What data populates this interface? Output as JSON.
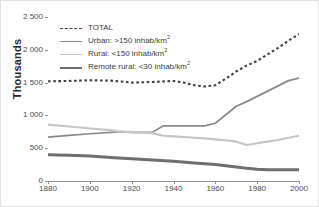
{
  "chart_data": {
    "type": "line",
    "title": "",
    "xlabel": "",
    "ylabel": "Thousands",
    "xlim": [
      1880,
      2000
    ],
    "ylim": [
      0,
      2500
    ],
    "grid": "horizontal",
    "legend_position": "top-left",
    "x_ticks": [
      "1880",
      "1900",
      "1920",
      "1940",
      "1960",
      "1980",
      "2000"
    ],
    "x_tick_values": [
      1880,
      1900,
      1920,
      1940,
      1960,
      1980,
      2000
    ],
    "y_ticks": [
      "0",
      "500",
      "1 000",
      "1 500",
      "2 000",
      "2 500"
    ],
    "y_tick_values": [
      0,
      500,
      1000,
      1500,
      2000,
      2500
    ],
    "series": [
      {
        "name": "TOTAL",
        "label": "TOTAL",
        "style": "dashed",
        "color": "#3f3f3f",
        "width": 2.1,
        "x": [
          1880,
          1890,
          1900,
          1910,
          1920,
          1930,
          1940,
          1945,
          1950,
          1955,
          1960,
          1965,
          1970,
          1975,
          1980,
          1985,
          1990,
          1995,
          2000
        ],
        "values": [
          1520,
          1525,
          1535,
          1530,
          1500,
          1510,
          1525,
          1500,
          1460,
          1440,
          1460,
          1560,
          1670,
          1760,
          1830,
          1930,
          2030,
          2140,
          2240
        ]
      },
      {
        "name": "Urban",
        "label": "Urban: >150 inhab/km",
        "label_sup": "2",
        "style": "solid",
        "color": "#8a8a8a",
        "width": 1.7,
        "x": [
          1880,
          1890,
          1900,
          1910,
          1915,
          1920,
          1930,
          1935,
          1940,
          1950,
          1955,
          1960,
          1965,
          1970,
          1975,
          1980,
          1985,
          1990,
          1995,
          2000
        ],
        "values": [
          670,
          695,
          720,
          740,
          752,
          740,
          745,
          840,
          840,
          840,
          840,
          880,
          1010,
          1140,
          1210,
          1290,
          1370,
          1450,
          1530,
          1570
        ]
      },
      {
        "name": "Rural",
        "label": "Rural: <150 inhab/km",
        "label_sup": "2",
        "style": "solid",
        "color": "#c6c6c6",
        "width": 2.1,
        "x": [
          1880,
          1890,
          1900,
          1910,
          1915,
          1920,
          1930,
          1935,
          1940,
          1950,
          1955,
          1960,
          1965,
          1970,
          1975,
          1980,
          1985,
          1990,
          1995,
          2000
        ],
        "values": [
          860,
          830,
          800,
          775,
          752,
          745,
          730,
          690,
          680,
          660,
          650,
          635,
          620,
          600,
          550,
          575,
          600,
          625,
          660,
          690
        ]
      },
      {
        "name": "Remote rural",
        "label": "Remote rural: <30 inhab/km",
        "label_sup": "2",
        "style": "solid",
        "color": "#6e6e6e",
        "width": 3.0,
        "x": [
          1880,
          1890,
          1900,
          1910,
          1920,
          1930,
          1940,
          1950,
          1960,
          1970,
          1975,
          1980,
          1985,
          1990,
          1995,
          2000
        ],
        "values": [
          400,
          392,
          380,
          360,
          340,
          320,
          300,
          275,
          250,
          215,
          195,
          180,
          172,
          170,
          170,
          172
        ]
      }
    ]
  },
  "axis": {
    "y_title": "Thousands"
  }
}
